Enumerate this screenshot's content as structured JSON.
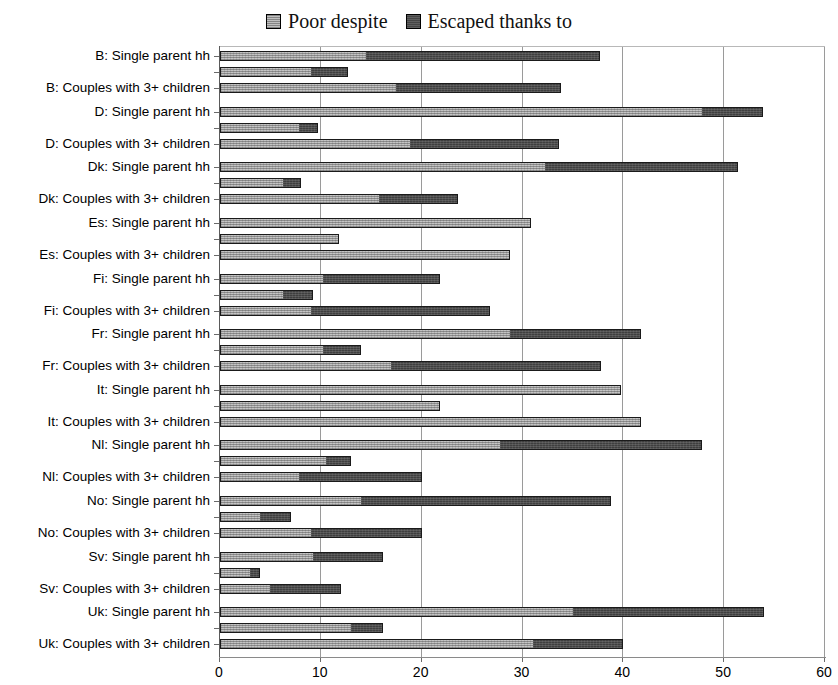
{
  "legend": {
    "entries": [
      {
        "label": "Poor despite",
        "swatch": "light-gray-square",
        "color": "#bfbfbf"
      },
      {
        "label": "Escaped thanks to",
        "swatch": "dark-gray-square",
        "color": "#454545"
      }
    ]
  },
  "axis": {
    "x_ticks": [
      "0",
      "10",
      "20",
      "30",
      "40",
      "50",
      "60"
    ],
    "x_min": 0,
    "x_max": 60,
    "x_step": 10
  },
  "chart_data": {
    "type": "bar",
    "orientation": "horizontal",
    "stacked": true,
    "title": "",
    "xlabel": "",
    "ylabel": "",
    "xlim": [
      0,
      60
    ],
    "xticks": [
      0,
      10,
      20,
      30,
      40,
      50,
      60
    ],
    "grid": "vertical",
    "legend_position": "top-center",
    "series": [
      {
        "name": "Poor despite",
        "color": "#bfbfbf"
      },
      {
        "name": "Escaped thanks to",
        "color": "#454545"
      }
    ],
    "categories": [
      "B: Single parent hh",
      "B: Couples with 3+ children",
      "D: Single parent hh",
      "D: Couples with 3+ children",
      "Dk: Single parent hh",
      "Dk: Couples with 3+ children",
      "Es: Single parent hh",
      "Es: Couples with 3+ children",
      "Fi: Single parent hh",
      "Fi: Couples with 3+ children",
      "Fr: Single parent hh",
      "Fr: Couples with 3+ children",
      "It: Single parent hh",
      "It: Couples with 3+ children",
      "Nl: Single parent hh",
      "Nl: Couples with 3+ children",
      "No: Single parent hh",
      "No: Couples with 3+ children",
      "Sv: Single parent hh",
      "Sv: Couples with 3+ children",
      "Uk: Single parent hh",
      "Uk: Couples with 3+ children"
    ],
    "groups": [
      {
        "country": "B",
        "bars": [
          {
            "label": "B: Single parent hh",
            "poor_despite": 14.5,
            "escaped_thanks_to": 37.7,
            "labeled": true
          },
          {
            "label": "",
            "poor_despite": 9.0,
            "escaped_thanks_to": 12.7,
            "labeled": false
          },
          {
            "label": "B: Couples with 3+ children",
            "poor_despite": 17.5,
            "escaped_thanks_to": 33.8,
            "labeled": true
          }
        ]
      },
      {
        "country": "D",
        "bars": [
          {
            "label": "D: Single parent hh",
            "poor_despite": 47.8,
            "escaped_thanks_to": 53.9,
            "labeled": true
          },
          {
            "label": "",
            "poor_despite": 7.8,
            "escaped_thanks_to": 9.7,
            "labeled": false
          },
          {
            "label": "D: Couples with 3+ children",
            "poor_despite": 18.8,
            "escaped_thanks_to": 33.6,
            "labeled": true
          }
        ]
      },
      {
        "country": "Dk",
        "bars": [
          {
            "label": "Dk: Single parent hh",
            "poor_despite": 32.2,
            "escaped_thanks_to": 51.4,
            "labeled": true
          },
          {
            "label": "",
            "poor_despite": 6.2,
            "escaped_thanks_to": 8.0,
            "labeled": false
          },
          {
            "label": "Dk: Couples with 3+ children",
            "poor_despite": 15.8,
            "escaped_thanks_to": 23.6,
            "labeled": true
          }
        ]
      },
      {
        "country": "Es",
        "bars": [
          {
            "label": "Es: Single parent hh",
            "poor_despite": 30.8,
            "escaped_thanks_to": 30.8,
            "labeled": true
          },
          {
            "label": "",
            "poor_despite": 11.8,
            "escaped_thanks_to": 11.8,
            "labeled": false
          },
          {
            "label": "Es: Couples with 3+ children",
            "poor_despite": 28.8,
            "escaped_thanks_to": 28.8,
            "labeled": true
          }
        ]
      },
      {
        "country": "Fi",
        "bars": [
          {
            "label": "Fi: Single parent hh",
            "poor_despite": 10.2,
            "escaped_thanks_to": 21.8,
            "labeled": true
          },
          {
            "label": "",
            "poor_despite": 6.2,
            "escaped_thanks_to": 9.2,
            "labeled": false
          },
          {
            "label": "Fi: Couples with 3+ children",
            "poor_despite": 9.0,
            "escaped_thanks_to": 26.8,
            "labeled": true
          }
        ]
      },
      {
        "country": "Fr",
        "bars": [
          {
            "label": "Fr: Single parent hh",
            "poor_despite": 28.8,
            "escaped_thanks_to": 41.8,
            "labeled": true
          },
          {
            "label": "",
            "poor_despite": 10.2,
            "escaped_thanks_to": 14.0,
            "labeled": false
          },
          {
            "label": "Fr: Couples with 3+ children",
            "poor_despite": 17.0,
            "escaped_thanks_to": 37.8,
            "labeled": true
          }
        ]
      },
      {
        "country": "It",
        "bars": [
          {
            "label": "It: Single parent hh",
            "poor_despite": 39.8,
            "escaped_thanks_to": 39.8,
            "labeled": true
          },
          {
            "label": "",
            "poor_despite": 21.8,
            "escaped_thanks_to": 21.8,
            "labeled": false
          },
          {
            "label": "It: Couples with 3+ children",
            "poor_despite": 41.8,
            "escaped_thanks_to": 41.8,
            "labeled": true
          }
        ]
      },
      {
        "country": "Nl",
        "bars": [
          {
            "label": "Nl: Single parent hh",
            "poor_despite": 27.8,
            "escaped_thanks_to": 47.8,
            "labeled": true
          },
          {
            "label": "",
            "poor_despite": 10.5,
            "escaped_thanks_to": 13.0,
            "labeled": false
          },
          {
            "label": "Nl: Couples with 3+ children",
            "poor_despite": 7.8,
            "escaped_thanks_to": 20.0,
            "labeled": true
          }
        ]
      },
      {
        "country": "No",
        "bars": [
          {
            "label": "No: Single parent hh",
            "poor_despite": 14.0,
            "escaped_thanks_to": 38.8,
            "labeled": true
          },
          {
            "label": "",
            "poor_despite": 4.0,
            "escaped_thanks_to": 7.0,
            "labeled": false
          },
          {
            "label": "No: Couples with 3+ children",
            "poor_despite": 9.0,
            "escaped_thanks_to": 20.0,
            "labeled": true
          }
        ]
      },
      {
        "country": "Sv",
        "bars": [
          {
            "label": "Sv: Single parent hh",
            "poor_despite": 9.2,
            "escaped_thanks_to": 16.2,
            "labeled": true
          },
          {
            "label": "",
            "poor_despite": 3.0,
            "escaped_thanks_to": 4.0,
            "labeled": false
          },
          {
            "label": "Sv: Couples with 3+ children",
            "poor_despite": 5.0,
            "escaped_thanks_to": 12.0,
            "labeled": true
          }
        ]
      },
      {
        "country": "Uk",
        "bars": [
          {
            "label": "Uk: Single parent hh",
            "poor_despite": 35.0,
            "escaped_thanks_to": 54.0,
            "labeled": true
          },
          {
            "label": "",
            "poor_despite": 13.0,
            "escaped_thanks_to": 16.2,
            "labeled": false
          },
          {
            "label": "Uk: Couples with 3+ children",
            "poor_despite": 31.0,
            "escaped_thanks_to": 40.0,
            "labeled": true
          }
        ]
      }
    ]
  }
}
